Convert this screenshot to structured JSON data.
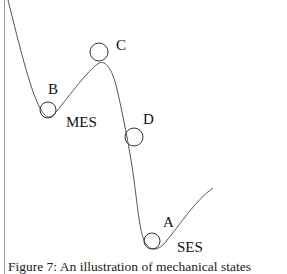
{
  "figure": {
    "caption": "Figure 7: An illustration of mechanical states",
    "labels": {
      "B": "B",
      "C": "C",
      "D": "D",
      "A": "A",
      "MES": "MES",
      "SES": "SES"
    },
    "colors": {
      "curve": "#555555",
      "text": "#111111",
      "rule": "#9a9a9a"
    }
  }
}
